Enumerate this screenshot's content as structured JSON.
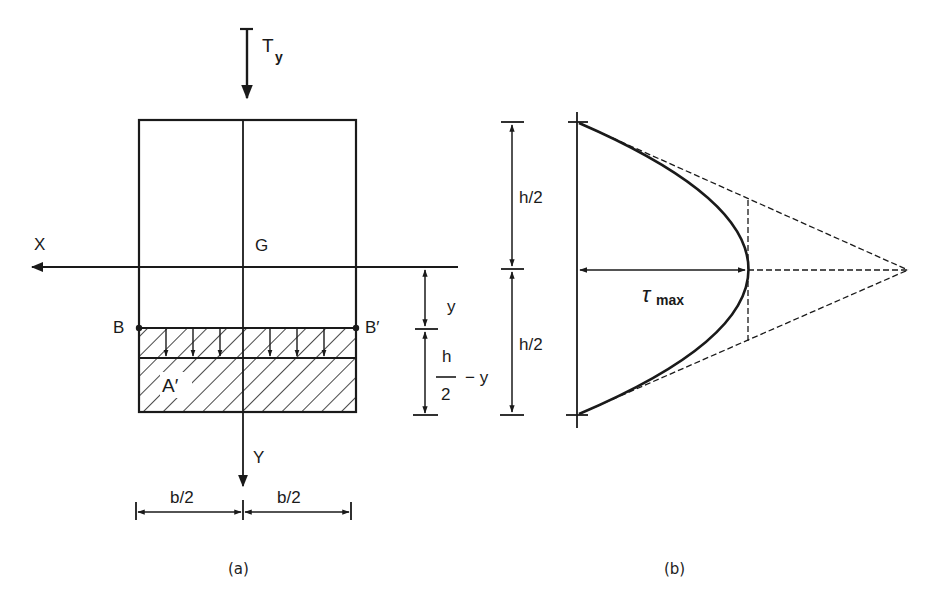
{
  "figure_a": {
    "caption": "(a)",
    "labels": {
      "force": "T",
      "force_sub": "y",
      "x_axis": "X",
      "y_axis": "Y",
      "centroid": "G",
      "point_left": "B",
      "point_right": "B′",
      "area": "A′",
      "dim_y": "y",
      "dim_h_num": "h",
      "dim_h_den": "2",
      "dim_h_minus": "− y",
      "dim_total_half": "h/2",
      "half_width_left": "b/2",
      "half_width_right": "b/2"
    }
  },
  "figure_b": {
    "caption": "(b)",
    "labels": {
      "upper_half": "h/2",
      "lower_half": "h/2",
      "tau": "τ",
      "tau_sub": "max"
    }
  },
  "colors": {
    "ink": "#1a1a1a",
    "background": "#ffffff"
  }
}
